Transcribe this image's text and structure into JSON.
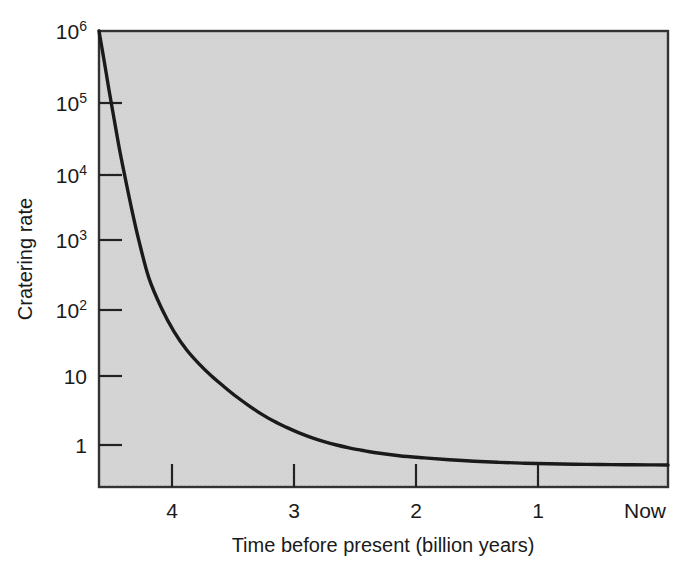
{
  "chart_data": {
    "type": "line",
    "title": "",
    "xlabel": "Time before present (billion years)",
    "ylabel": "Cratering rate",
    "yscale": "log",
    "xscale": "linear",
    "grid": false,
    "legend": null,
    "xlim": [
      4.4,
      -0.15
    ],
    "ylim": [
      0.25,
      1000000
    ],
    "x_tick_labels": [
      "4",
      "3",
      "2",
      "1",
      "Now"
    ],
    "x_tick_values": [
      4,
      3,
      2,
      1,
      0
    ],
    "y_tick_labels": [
      "10⁶",
      "10⁵",
      "10⁴",
      "10³",
      "10²",
      "10",
      "1"
    ],
    "y_tick_values": [
      1000000,
      100000,
      10000,
      1000,
      100,
      10,
      1
    ],
    "y_tick_mantissas": [
      "10",
      "10",
      "10",
      "10",
      "10",
      "10",
      "1"
    ],
    "y_tick_exponents": [
      "6",
      "5",
      "4",
      "3",
      "2",
      "",
      ""
    ],
    "series": [
      {
        "name": "Cratering rate",
        "x": [
          4.4,
          4.36,
          4.32,
          4.28,
          4.24,
          4.2,
          4.14,
          4.08,
          4.0,
          3.9,
          3.8,
          3.7,
          3.6,
          3.5,
          3.4,
          3.3,
          3.2,
          3.1,
          3.0,
          2.9,
          2.8,
          2.7,
          2.6,
          2.5,
          2.4,
          2.3,
          2.2,
          2.0,
          1.8,
          1.6,
          1.4,
          1.2,
          1.0,
          0.8,
          0.6,
          0.4,
          0.2,
          0.0,
          -0.15
        ],
        "y": [
          1000000,
          380000,
          140000,
          54000,
          21000,
          9000,
          2700,
          900,
          260,
          96,
          44,
          24,
          15,
          10.0,
          7.0,
          5.0,
          3.7,
          2.8,
          2.2,
          1.8,
          1.5,
          1.28,
          1.12,
          1.0,
          0.91,
          0.84,
          0.78,
          0.7,
          0.65,
          0.61,
          0.58,
          0.56,
          0.545,
          0.535,
          0.527,
          0.521,
          0.517,
          0.515,
          0.514
        ]
      }
    ]
  },
  "figure": {
    "plot_bg_color": "#d4d4d4",
    "page_bg_color": "#ffffff",
    "curve_color": "#1a1a1a",
    "axis_color": "#1a1a1a",
    "tick_color": "#1a1a1a"
  },
  "labels": {
    "y_axis_title": "Cratering rate",
    "x_axis_title": "Time before present (billion years)"
  }
}
